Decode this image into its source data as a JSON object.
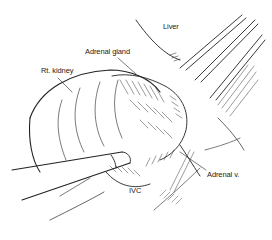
{
  "figure": {
    "labels": {
      "liver": "Liver",
      "adrenal_gland": "Adrenal gland",
      "rt_kidney": "Rt. kidney",
      "ivc": "IVC",
      "adrenal_vein": "Adrenal v."
    },
    "colors": {
      "ink": "#222222",
      "background": "#ffffff"
    }
  }
}
